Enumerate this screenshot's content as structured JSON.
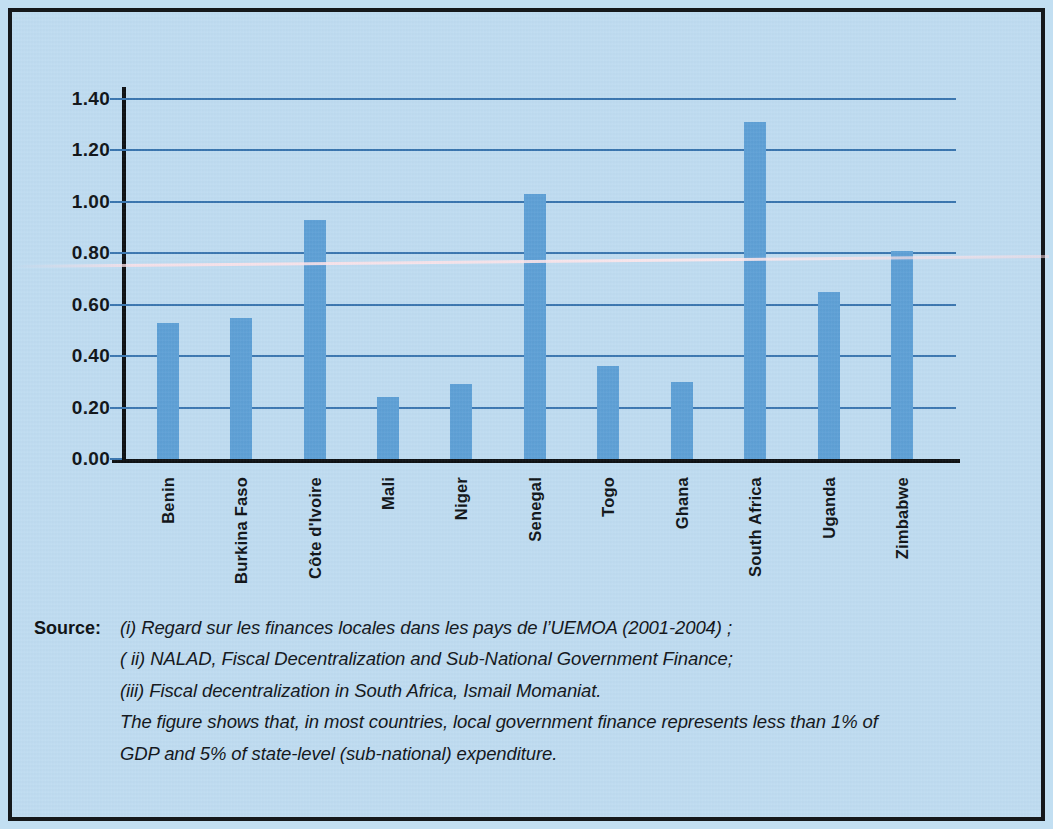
{
  "chart_data": {
    "type": "bar",
    "title": "",
    "subtitle": "",
    "xlabel": "",
    "ylabel": "",
    "ylim": [
      0.0,
      1.4
    ],
    "grid": true,
    "legend": null,
    "categories": [
      "Benin",
      "Burkina Faso",
      "Côte d'Ivoire",
      "Mali",
      "Niger",
      "Senegal",
      "Togo",
      "Ghana",
      "South Africa",
      "Uganda",
      "Zimbabwe"
    ],
    "values": [
      0.53,
      0.55,
      0.93,
      0.24,
      0.29,
      1.03,
      0.36,
      0.3,
      1.31,
      0.65,
      0.81
    ],
    "ytick_labels": [
      "1.40",
      "1.20",
      "1.00",
      "0.80",
      "0.60",
      "0.40",
      "0.20",
      "0.00"
    ],
    "ytick_values": [
      1.4,
      1.2,
      1.0,
      0.8,
      0.6,
      0.4,
      0.2,
      0.0
    ],
    "series": [
      {
        "name": "Local government finance (% of GDP)",
        "values": [
          0.53,
          0.55,
          0.93,
          0.24,
          0.29,
          1.03,
          0.36,
          0.3,
          1.31,
          0.65,
          0.81
        ]
      }
    ],
    "colors": {
      "bar": "#5ea0d6",
      "gridline": "#3a76b0",
      "axis": "#0d1013",
      "background": "#bfdcf1",
      "text": "#101418",
      "frame": "#15181b"
    }
  },
  "source": {
    "label": "Source:",
    "lines": [
      "(i) Regard sur les finances locales dans les pays de l’UEMOA (2001-2004) ;",
      "( ii) NALAD, Fiscal Decentralization and Sub-National Government Finance;",
      "(iii) Fiscal decentralization in South Africa, Ismail Momaniat."
    ],
    "note": [
      "The figure shows that, in most countries, local government finance represents less than 1% of",
      "GDP and 5% of state-level (sub-national) expenditure."
    ]
  }
}
